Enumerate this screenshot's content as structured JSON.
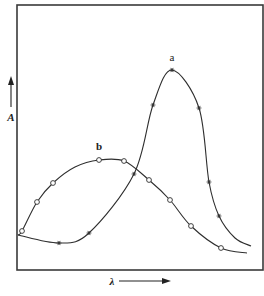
{
  "chart_data": {
    "type": "line",
    "title": "",
    "xlabel": "λ",
    "ylabel": "A",
    "grid": false,
    "legend": "inline curve labels",
    "frame": {
      "x0": 17,
      "y0": 5,
      "x1": 263,
      "y1": 270
    },
    "series": [
      {
        "name": "a",
        "marker": "asterisk",
        "label_pos": {
          "x": 172,
          "y": 61
        },
        "path_points": [
          [
            18,
            235
          ],
          [
            59,
            243
          ],
          [
            89,
            233
          ],
          [
            134,
            174
          ],
          [
            153,
            105
          ],
          [
            172,
            70
          ],
          [
            199,
            108
          ],
          [
            209,
            182
          ],
          [
            219,
            216
          ],
          [
            235,
            238
          ],
          [
            251,
            246
          ]
        ],
        "markers": [
          [
            59,
            243
          ],
          [
            89,
            233
          ],
          [
            134,
            174
          ],
          [
            153,
            105
          ],
          [
            172,
            70
          ],
          [
            199,
            108
          ],
          [
            209,
            182
          ],
          [
            219,
            216
          ]
        ]
      },
      {
        "name": "b",
        "marker": "open-circle",
        "label_pos": {
          "x": 99,
          "y": 150
        },
        "path_points": [
          [
            18,
            235
          ],
          [
            22,
            231
          ],
          [
            37,
            202
          ],
          [
            53,
            183
          ],
          [
            75,
            167
          ],
          [
            99,
            160
          ],
          [
            124,
            161
          ],
          [
            149,
            180
          ],
          [
            170,
            200
          ],
          [
            191,
            226
          ],
          [
            221,
            248
          ],
          [
            247,
            253
          ]
        ],
        "markers": [
          [
            22,
            231
          ],
          [
            37,
            202
          ],
          [
            53,
            183
          ],
          [
            99,
            160
          ],
          [
            124,
            161
          ],
          [
            149,
            180
          ],
          [
            170,
            200
          ],
          [
            191,
            226
          ],
          [
            221,
            248
          ]
        ]
      }
    ]
  },
  "labels": {
    "curve_a": "a",
    "curve_b": "b",
    "x_axis": "λ",
    "y_axis": "A"
  }
}
